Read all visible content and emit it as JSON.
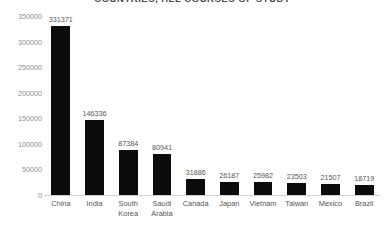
{
  "chart_data": {
    "type": "bar",
    "title": "COUNTRIES, ALL COURSES OF STUDY",
    "xlabel": "",
    "ylabel": "",
    "ylim": [
      0,
      350000
    ],
    "ytick_values": [
      350000,
      300000,
      250000,
      200000,
      150000,
      100000,
      50000,
      0
    ],
    "yticks": [
      "350000",
      "300000",
      "250000",
      "200000",
      "150000",
      "100000",
      "50000",
      "0"
    ],
    "grid": false,
    "legend": false,
    "bar_color": "#0c0c0c",
    "categories": [
      "China",
      "India",
      "South Korea",
      "Saudi Arabia",
      "Canada",
      "Japan",
      "Vietnam",
      "Taiwan",
      "Mexico",
      "Brazil"
    ],
    "category_lines": [
      [
        "China"
      ],
      [
        "India"
      ],
      [
        "South",
        "Korea"
      ],
      [
        "Saudi",
        "Arabia"
      ],
      [
        "Canada"
      ],
      [
        "Japan"
      ],
      [
        "Vietnam"
      ],
      [
        "Taiwan"
      ],
      [
        "Mexico"
      ],
      [
        "Brazil"
      ]
    ],
    "values": [
      331371,
      146336,
      87384,
      80941,
      31886,
      26187,
      25982,
      23503,
      21507,
      18719
    ],
    "data_labels": [
      "331371",
      "146336",
      "87384",
      "80941",
      "31886",
      "26187",
      "25982",
      "23503",
      "21507",
      "18719"
    ]
  }
}
